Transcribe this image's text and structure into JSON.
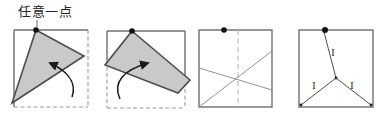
{
  "annotation": {
    "label": "任意一点"
  },
  "figure4": {
    "segment_labels": [
      "I",
      "I",
      "I"
    ]
  },
  "colors": {
    "flap_fill": "#c9c9c9",
    "flap_stroke": "#4d4d4d",
    "square_stroke": "#6e6e6e",
    "dot": "#111111",
    "crease": "#848484",
    "dashed": "#9a9a9a",
    "arrow": "#1a1a1a"
  }
}
